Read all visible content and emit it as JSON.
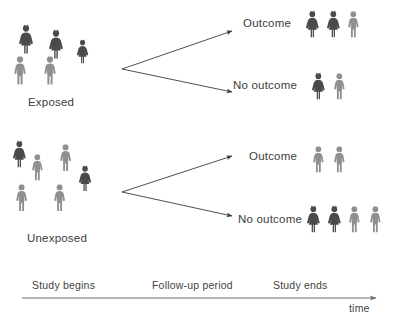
{
  "figure": {
    "background_color": "#ffffff",
    "colors": {
      "dark_figure": "#4a4a4a",
      "light_figure": "#8f8f8f",
      "arrow": "#3b3b3b",
      "text": "#3c3c3c",
      "timeline": "#6e6e6e"
    }
  },
  "groups": [
    {
      "id": "exposed",
      "label": "Exposed",
      "icon_name": "people-group-exposed",
      "members": [
        {
          "shade": "dark",
          "sex": "female",
          "x": 18,
          "y": 24,
          "scale": 1.0
        },
        {
          "shade": "dark",
          "sex": "female",
          "x": 48,
          "y": 29,
          "scale": 1.0
        },
        {
          "shade": "dark",
          "sex": "female",
          "x": 76,
          "y": 39,
          "scale": 0.82
        },
        {
          "shade": "light",
          "sex": "male",
          "x": 12,
          "y": 55,
          "scale": 1.0
        },
        {
          "shade": "light",
          "sex": "male",
          "x": 42,
          "y": 55,
          "scale": 1.0
        }
      ]
    },
    {
      "id": "unexposed",
      "label": "Unexposed",
      "icon_name": "people-group-unexposed",
      "members": [
        {
          "shade": "dark",
          "sex": "female",
          "x": 12,
          "y": 140,
          "scale": 0.92
        },
        {
          "shade": "light",
          "sex": "male",
          "x": 30,
          "y": 153,
          "scale": 0.92
        },
        {
          "shade": "light",
          "sex": "male",
          "x": 58,
          "y": 143,
          "scale": 0.95
        },
        {
          "shade": "dark",
          "sex": "female",
          "x": 78,
          "y": 165,
          "scale": 0.88
        },
        {
          "shade": "light",
          "sex": "male",
          "x": 14,
          "y": 183,
          "scale": 0.95
        },
        {
          "shade": "light",
          "sex": "male",
          "x": 52,
          "y": 183,
          "scale": 0.95
        }
      ]
    }
  ],
  "branches": [
    {
      "id": "exposed-outcome",
      "group": "exposed",
      "label": "Outcome",
      "label_x": 243,
      "label_y": 17,
      "arrow": {
        "x1": 122,
        "y1": 69,
        "x2": 232,
        "y2": 31
      },
      "people": [
        {
          "shade": "dark",
          "sex": "female"
        },
        {
          "shade": "dark",
          "sex": "female"
        },
        {
          "shade": "light",
          "sex": "male"
        }
      ],
      "people_x": 305,
      "people_y": 10
    },
    {
      "id": "exposed-no-outcome",
      "group": "exposed",
      "label": "No  outcome",
      "label_x": 233,
      "label_y": 79,
      "arrow": {
        "x1": 122,
        "y1": 69,
        "x2": 232,
        "y2": 92
      },
      "people": [
        {
          "shade": "dark",
          "sex": "female"
        },
        {
          "shade": "light",
          "sex": "male"
        }
      ],
      "people_x": 311,
      "people_y": 72
    },
    {
      "id": "unexposed-outcome",
      "group": "unexposed",
      "label": "Outcome",
      "label_x": 249,
      "label_y": 150,
      "arrow": {
        "x1": 122,
        "y1": 192,
        "x2": 232,
        "y2": 156
      },
      "people": [
        {
          "shade": "light",
          "sex": "male"
        },
        {
          "shade": "light",
          "sex": "male"
        }
      ],
      "people_x": 311,
      "people_y": 145
    },
    {
      "id": "unexposed-no-outcome",
      "group": "unexposed",
      "label": "No  outcome",
      "label_x": 238,
      "label_y": 213,
      "arrow": {
        "x1": 122,
        "y1": 192,
        "x2": 232,
        "y2": 216
      },
      "people": [
        {
          "shade": "dark",
          "sex": "female"
        },
        {
          "shade": "dark",
          "sex": "female"
        },
        {
          "shade": "light",
          "sex": "male"
        },
        {
          "shade": "light",
          "sex": "male"
        }
      ],
      "people_x": 306,
      "people_y": 205
    }
  ],
  "timeline": {
    "stages": [
      {
        "label": "Study begins",
        "x": 32,
        "y": 279
      },
      {
        "label": "Follow-up period",
        "x": 152,
        "y": 279
      },
      {
        "label": "Study ends",
        "x": 273,
        "y": 279
      }
    ],
    "axis": {
      "x1": 22,
      "y1": 298,
      "x2": 376,
      "y2": 298
    },
    "axis_label": "time",
    "axis_label_x": 348,
    "axis_label_y": 302
  }
}
